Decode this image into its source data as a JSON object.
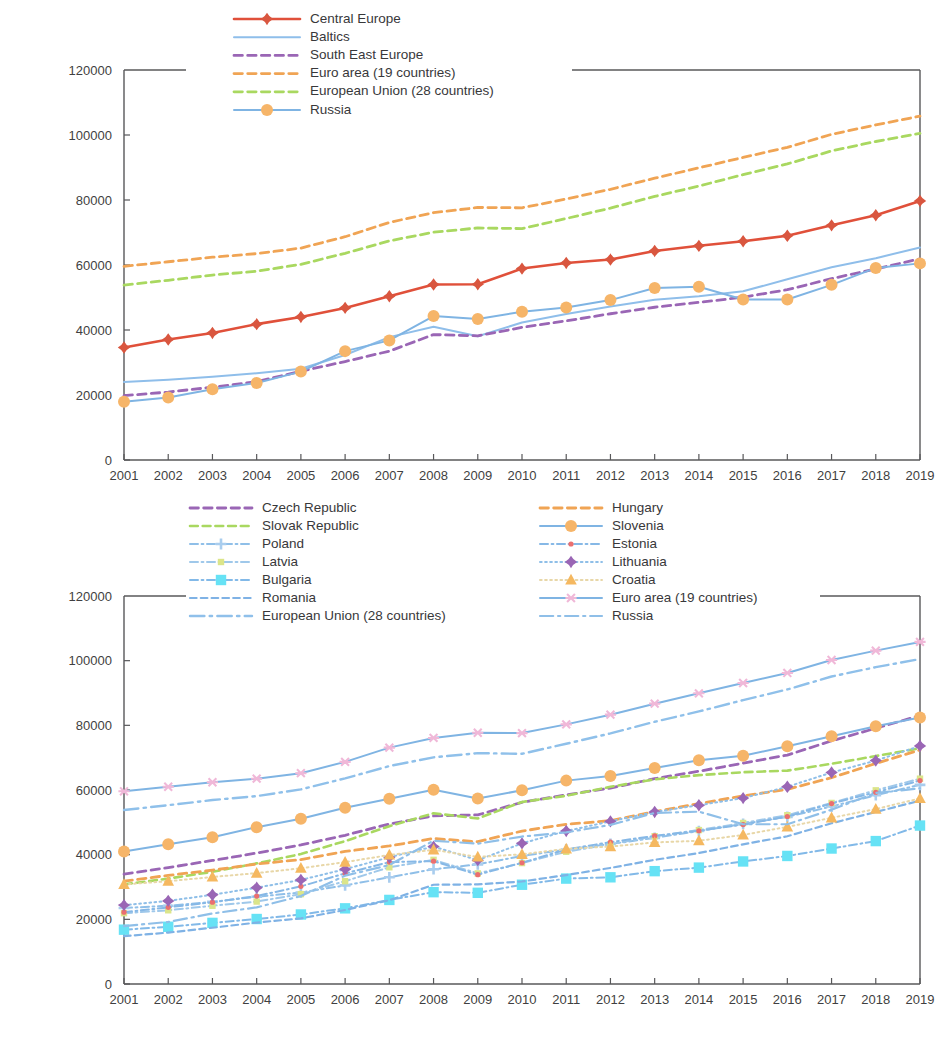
{
  "chart_data": [
    {
      "id": "chart-regions",
      "type": "line",
      "title": "",
      "subtitle": "",
      "xlabel": "",
      "ylabel": "",
      "grid": false,
      "legend_position": "top-inside-left",
      "xlim": [
        2001,
        2019
      ],
      "ylim": [
        0,
        120000
      ],
      "ytick_values": [
        0,
        20000,
        40000,
        60000,
        80000,
        100000,
        120000
      ],
      "ytick_labels": [
        "0",
        "20000",
        "40000",
        "60000",
        "80000",
        "100000",
        "120000"
      ],
      "x": [
        2001,
        2002,
        2003,
        2004,
        2005,
        2006,
        2007,
        2008,
        2009,
        2010,
        2011,
        2012,
        2013,
        2014,
        2015,
        2016,
        2017,
        2018,
        2019
      ],
      "xtick_labels": [
        "2001",
        "2002",
        "2003",
        "2004",
        "2005",
        "2006",
        "2007",
        "2008",
        "2009",
        "2010",
        "2011",
        "2012",
        "2013",
        "2014",
        "2015",
        "2016",
        "2017",
        "2018",
        "2019"
      ],
      "series": [
        {
          "name": "Central Europe",
          "color": "#e0503a",
          "dash": "none",
          "marker": "diamond",
          "marker_color": "#d9563f",
          "width": 2.6,
          "values": [
            34600,
            37100,
            39100,
            41800,
            44000,
            46800,
            50400,
            54000,
            54100,
            58900,
            60600,
            61700,
            64300,
            65900,
            67300,
            69000,
            72200,
            75300,
            79700
          ]
        },
        {
          "name": "Baltics",
          "color": "#8fbeea",
          "dash": "none",
          "marker": "none",
          "marker_color": "#8fbeea",
          "width": 2.0,
          "values": [
            24000,
            24700,
            25600,
            26700,
            28100,
            32300,
            37800,
            41000,
            38100,
            42300,
            44900,
            47200,
            49300,
            50400,
            51900,
            55600,
            59300,
            62100,
            65400
          ]
        },
        {
          "name": "South East Europe",
          "color": "#9a66b5",
          "dash": "dashed",
          "marker": "none",
          "marker_color": "#9a66b5",
          "width": 2.8,
          "values": [
            19800,
            20900,
            22400,
            24100,
            27300,
            30300,
            33500,
            38600,
            38200,
            40800,
            42800,
            45000,
            47000,
            48500,
            50100,
            52400,
            55800,
            58800,
            61900
          ]
        },
        {
          "name": "Euro area (19 countries)",
          "color": "#f0a454",
          "dash": "dashed",
          "marker": "none",
          "marker_color": "#f0a454",
          "width": 2.8,
          "values": [
            59600,
            61000,
            62400,
            63500,
            65200,
            68700,
            73100,
            76100,
            77700,
            77600,
            80300,
            83300,
            86700,
            89900,
            93100,
            96200,
            100200,
            103100,
            105800
          ]
        },
        {
          "name": "European Union (28 countries)",
          "color": "#a9d860",
          "dash": "dashed",
          "marker": "none",
          "marker_color": "#a9d860",
          "width": 2.8,
          "values": [
            53800,
            55300,
            56900,
            58100,
            60200,
            63600,
            67400,
            70100,
            71400,
            71200,
            74300,
            77500,
            81100,
            84300,
            87800,
            91100,
            95100,
            98000,
            100500
          ]
        },
        {
          "name": "Russia",
          "color": "#7fb4e3",
          "dash": "none",
          "marker": "circle",
          "marker_color": "#f6b569",
          "width": 2.0,
          "values": [
            17900,
            19200,
            21800,
            23700,
            27200,
            33500,
            36800,
            44300,
            43400,
            45600,
            46900,
            49200,
            52900,
            53300,
            49400,
            49400,
            53900,
            59100,
            60500
          ]
        }
      ]
    },
    {
      "id": "chart-countries",
      "type": "line",
      "title": "",
      "subtitle": "",
      "xlabel": "",
      "ylabel": "",
      "grid": false,
      "legend_position": "top-inside-two-columns",
      "xlim": [
        2001,
        2019
      ],
      "ylim": [
        0,
        120000
      ],
      "ytick_values": [
        0,
        20000,
        40000,
        60000,
        80000,
        100000,
        120000
      ],
      "ytick_labels": [
        "0",
        "20000",
        "40000",
        "60000",
        "80000",
        "100000",
        "120000"
      ],
      "x": [
        2001,
        2002,
        2003,
        2004,
        2005,
        2006,
        2007,
        2008,
        2009,
        2010,
        2011,
        2012,
        2013,
        2014,
        2015,
        2016,
        2017,
        2018,
        2019
      ],
      "xtick_labels": [
        "2001",
        "2002",
        "2003",
        "2004",
        "2005",
        "2006",
        "2007",
        "2008",
        "2009",
        "2010",
        "2011",
        "2012",
        "2013",
        "2014",
        "2015",
        "2016",
        "2017",
        "2018",
        "2019"
      ],
      "series": [
        {
          "name": "Czech Republic",
          "color": "#9a66b5",
          "dash": "dashed",
          "marker": "none",
          "marker_color": "#9a66b5",
          "width": 2.8,
          "values": [
            34000,
            36000,
            38200,
            40500,
            43000,
            46000,
            49500,
            52000,
            52300,
            56200,
            58500,
            60600,
            63500,
            65800,
            68300,
            70800,
            75200,
            79100,
            83000
          ]
        },
        {
          "name": "Slovak Republic",
          "color": "#a9d860",
          "dash": "dashed",
          "marker": "none",
          "marker_color": "#a9d860",
          "width": 2.6,
          "values": [
            30800,
            32600,
            34700,
            37300,
            40200,
            44200,
            48800,
            52800,
            51200,
            56300,
            58200,
            61000,
            63300,
            64600,
            65500,
            66000,
            68100,
            70500,
            72900
          ]
        },
        {
          "name": "Poland",
          "color": "#8fbfe8",
          "dash": "dash-dot",
          "marker": "plus",
          "marker_color": "#a9cdee",
          "width": 2.0,
          "values": [
            23500,
            24200,
            25400,
            27000,
            28300,
            30500,
            33000,
            35500,
            37000,
            39600,
            41600,
            43300,
            45200,
            47300,
            49500,
            51700,
            54900,
            58400,
            61600
          ]
        },
        {
          "name": "Latvia",
          "color": "#9fc8ea",
          "dash": "dash-dot",
          "marker": "small-square",
          "marker_color": "#dbe58a",
          "width": 2.0,
          "values": [
            21900,
            22800,
            24200,
            25500,
            27800,
            31800,
            36100,
            38400,
            34200,
            37400,
            40900,
            43200,
            45700,
            47600,
            49800,
            52200,
            56000,
            59900,
            63500
          ]
        },
        {
          "name": "Bulgaria",
          "color": "#82b9e8",
          "dash": "dash-dot",
          "marker": "square",
          "marker_color": "#66e2f5",
          "width": 2.0,
          "values": [
            16800,
            17700,
            18900,
            20100,
            21500,
            23400,
            26000,
            28400,
            28200,
            30700,
            32600,
            33000,
            34900,
            36000,
            37900,
            39600,
            41900,
            44200,
            49000
          ]
        },
        {
          "name": "Romania",
          "color": "#7fb2e5",
          "dash": "dashed",
          "marker": "none",
          "marker_color": "#7fb2e5",
          "width": 2.2,
          "values": [
            14800,
            15900,
            17400,
            19000,
            20300,
            22900,
            25900,
            30700,
            30800,
            31700,
            33700,
            35900,
            38400,
            40500,
            43200,
            45700,
            49700,
            53200,
            56700
          ]
        },
        {
          "name": "European Union (28 countries)",
          "color": "#8fc0ea",
          "dash": "long-dash-dot",
          "marker": "none",
          "marker_color": "#8fc0ea",
          "width": 2.4,
          "values": [
            53800,
            55300,
            56900,
            58100,
            60200,
            63600,
            67400,
            70100,
            71400,
            71200,
            74300,
            77500,
            81100,
            84300,
            87800,
            91100,
            95100,
            98000,
            100500
          ]
        },
        {
          "name": "Hungary",
          "color": "#f0a454",
          "dash": "dashed",
          "marker": "none",
          "marker_color": "#f0a454",
          "width": 2.8,
          "values": [
            31800,
            33600,
            35200,
            37100,
            38500,
            41000,
            42700,
            45000,
            44000,
            47300,
            49400,
            50500,
            53300,
            55800,
            58200,
            60200,
            63800,
            68200,
            72400
          ]
        },
        {
          "name": "Slovenia",
          "color": "#7fb4e3",
          "dash": "none",
          "marker": "circle",
          "marker_color": "#f6b569",
          "width": 2.0,
          "values": [
            41000,
            43200,
            45400,
            48500,
            51100,
            54500,
            57300,
            60100,
            57400,
            59900,
            62900,
            64300,
            66800,
            69200,
            70600,
            73500,
            76600,
            79700,
            82400
          ]
        },
        {
          "name": "Estonia",
          "color": "#86b8e6",
          "dash": "dash-dot",
          "marker": "small-dot",
          "marker_color": "#eb6f6f",
          "width": 2.0,
          "values": [
            22200,
            23700,
            25300,
            27200,
            30200,
            34200,
            37700,
            38000,
            33800,
            37500,
            41600,
            43900,
            45800,
            47400,
            49300,
            51800,
            55800,
            59300,
            62900
          ]
        },
        {
          "name": "Lithuania",
          "color": "#8fbfe8",
          "dash": "dotted",
          "marker": "diamond",
          "marker_color": "#9a66b5",
          "width": 2.0,
          "values": [
            24400,
            25700,
            27600,
            29800,
            32200,
            35500,
            39200,
            42500,
            38300,
            43500,
            47300,
            50300,
            53200,
            55300,
            57500,
            61000,
            65400,
            69100,
            73600
          ]
        },
        {
          "name": "Croatia",
          "color": "#e8d7a8",
          "dash": "dotted",
          "marker": "triangle",
          "marker_color": "#f5b860",
          "width": 2.0,
          "values": [
            30800,
            31800,
            33100,
            34300,
            35800,
            37700,
            39900,
            41500,
            39300,
            40100,
            41800,
            42500,
            43800,
            44300,
            46100,
            48600,
            51400,
            54100,
            57400
          ]
        },
        {
          "name": "Euro area (19 countries)",
          "color": "#7fb4e3",
          "dash": "none",
          "marker": "star",
          "marker_color": "#f0b8d8",
          "width": 2.0,
          "values": [
            59600,
            61000,
            62400,
            63500,
            65200,
            68700,
            73100,
            76100,
            77700,
            77600,
            80300,
            83300,
            86700,
            89900,
            93100,
            96200,
            100200,
            103100,
            105800
          ]
        },
        {
          "name": "Russia",
          "color": "#8fbfe8",
          "dash": "long-dash-dot",
          "marker": "none",
          "marker_color": "#8fbfe8",
          "width": 2.2,
          "values": [
            17900,
            19200,
            21800,
            23700,
            27200,
            33500,
            36800,
            44300,
            43400,
            45600,
            46900,
            49200,
            52900,
            53300,
            49400,
            49400,
            53900,
            59100,
            60500
          ]
        }
      ],
      "legend_columns": [
        [
          "Czech Republic",
          "Slovak Republic",
          "Poland",
          "Latvia",
          "Bulgaria",
          "Romania",
          "European Union (28 countries)"
        ],
        [
          "Hungary",
          "Slovenia",
          "Estonia",
          "Lithuania",
          "Croatia",
          "Euro area (19 countries)",
          "Russia"
        ]
      ]
    }
  ]
}
